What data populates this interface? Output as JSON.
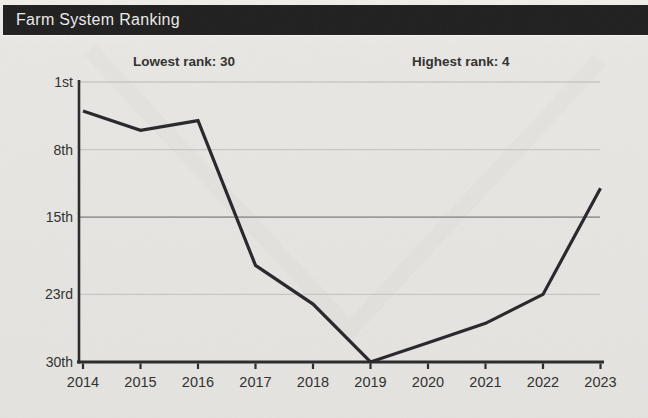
{
  "header": {
    "title": "Farm System Ranking"
  },
  "annotations": {
    "lowest": "Lowest rank: 30",
    "highest": "Highest rank: 4"
  },
  "chart_data": {
    "type": "line",
    "title": "Farm System Ranking",
    "series_name": "Farm system rank",
    "x": [
      2014,
      2015,
      2016,
      2017,
      2018,
      2019,
      2020,
      2021,
      2022,
      2023
    ],
    "values": [
      4,
      6,
      5,
      20,
      24,
      30,
      28,
      26,
      23,
      12
    ],
    "xlabel": "",
    "ylabel": "Rank",
    "y_axis": {
      "inverted": true,
      "range": [
        1,
        30
      ],
      "ticks": [
        1,
        8,
        15,
        23,
        30
      ],
      "tick_labels": [
        "1st",
        "8th",
        "15th",
        "23rd",
        "30th"
      ],
      "emphasized_gridline": 15
    },
    "grid": "horizontal",
    "legend": "none",
    "annotations": [
      "Lowest rank: 30",
      "Highest rank: 4"
    ],
    "colors": {
      "line": "#26262a",
      "axis": "#29292b",
      "grid_light": "#c7c7c4",
      "grid_mid": "#99999a",
      "tick_text": "#2e2e2c",
      "header_bg": "#1e1e1e",
      "header_text": "#ebebe8",
      "background": "#e6e5e2"
    }
  }
}
